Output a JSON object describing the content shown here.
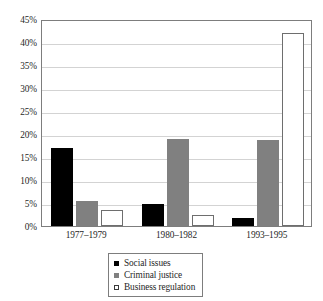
{
  "chart_data": {
    "type": "bar",
    "title": "",
    "subtitle": "",
    "xlabel": "",
    "ylabel": "",
    "categories": [
      "1977–1979",
      "1980–1982",
      "1993–1995"
    ],
    "series": [
      {
        "name": "Social issues",
        "color": "#000000",
        "values": [
          17.0,
          4.7,
          1.8
        ]
      },
      {
        "name": "Criminal justice",
        "color": "#808080",
        "values": [
          5.5,
          19.0,
          18.6
        ]
      },
      {
        "name": "Business regulation",
        "color": "#ffffff",
        "values": [
          3.5,
          2.5,
          42.0
        ]
      }
    ],
    "ylim": [
      0,
      45
    ],
    "ytick_step": 5,
    "ytick_labels": [
      "0%",
      "5%",
      "10%",
      "15%",
      "20%",
      "25%",
      "30%",
      "35%",
      "40%",
      "45%"
    ],
    "ytick_values": [
      0,
      5,
      10,
      15,
      20,
      25,
      30,
      35,
      40,
      45
    ],
    "grid": true,
    "grid_axis": "y",
    "legend_position": "bottom-center",
    "legend_entries": [
      "Social issues",
      "Criminal justice",
      "Business regulation"
    ],
    "annotations": []
  }
}
